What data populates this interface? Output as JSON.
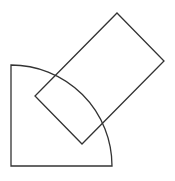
{
  "diagram": {
    "shapes": [
      {
        "name": "quarter-circle-sector",
        "type": "sector",
        "angle_degrees": 90
      },
      {
        "name": "rotated-rectangle",
        "type": "rectangle",
        "rotation_degrees": 45
      }
    ],
    "colors": {
      "stroke": "#333333",
      "background": "#ffffff"
    }
  }
}
